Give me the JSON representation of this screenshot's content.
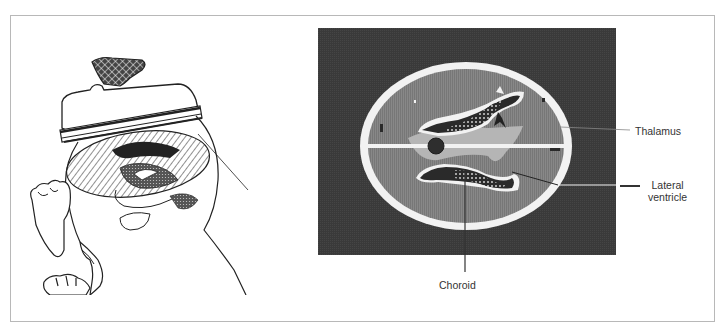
{
  "figure": {
    "left_panel": {
      "description": "Line drawing of infant head with ultrasound transducer placed on the fontanelle, showing axial imaging plane through brain"
    },
    "right_panel": {
      "description": "Axial ultrasound scan of infant brain showing lateral ventricles, choroid plexus and thalamus"
    },
    "labels": {
      "thalamus": "Thalamus",
      "lateral_ventricle_line1": "Lateral",
      "lateral_ventricle_line2": "ventricle",
      "choroid": "Choroid"
    },
    "colors": {
      "scan_background": "#3a3a3a",
      "brain_tissue": "#8a8a8a",
      "skull": "#f2f2f2",
      "ventricle_dark": "#2a2a2a",
      "midline_region": "#b5b5b5",
      "frame_border": "#b8b8b8",
      "label_text": "#333333"
    }
  }
}
